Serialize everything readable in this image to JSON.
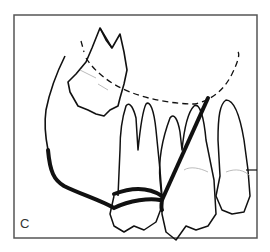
{
  "figure": {
    "panel_label": "C",
    "colors": {
      "line": "#111111",
      "frame": "#555555",
      "background": "#ffffff"
    },
    "elements": [
      "impacted upper tooth",
      "dashed arch curve",
      "thick wire contour",
      "angled reference line",
      "row of molar/premolar teeth"
    ]
  }
}
